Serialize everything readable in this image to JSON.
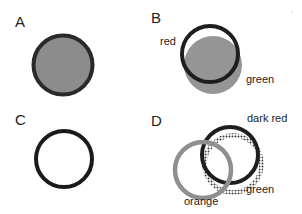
{
  "colors": {
    "background": "#ffffff",
    "dark_ring": "#1e1e1e",
    "gray_fill": "#8c8c8c",
    "orange_ring": "#8f8f8f",
    "green_dotted_ring": "#4a4a4a",
    "text": "#222222"
  },
  "panels": {
    "A": {
      "label": "A",
      "description": "filled gray circle with dark outline"
    },
    "B": {
      "label": "B",
      "annotations": {
        "red": "red",
        "green": "green"
      },
      "description": "dark ring (red) overlapping gray disc (green)"
    },
    "C": {
      "label": "C",
      "description": "dark ring, no fill"
    },
    "D": {
      "label": "D",
      "annotations": {
        "dark_red": "dark red",
        "green": "green",
        "orange": "orange"
      },
      "description": "three overlapping rings: dark red (solid dark), green (dotted), orange (gray)"
    }
  }
}
